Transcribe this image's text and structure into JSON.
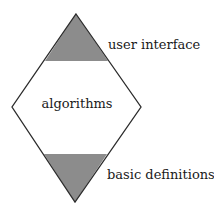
{
  "diagram": {
    "type": "layered-diamond",
    "shape": {
      "top": [
        76,
        14
      ],
      "left": [
        12,
        107
      ],
      "right": [
        141,
        107
      ],
      "bottom": [
        75,
        202
      ]
    },
    "layers": [
      {
        "id": "top-band",
        "label": "user interface",
        "fill": "#8c8c8c",
        "position": "top"
      },
      {
        "id": "middle",
        "label": "algorithms",
        "fill": "#ffffff",
        "position": "middle"
      },
      {
        "id": "bottom-band",
        "label": "basic definitions",
        "fill": "#8c8c8c",
        "position": "bottom"
      }
    ],
    "colors": {
      "stroke": "#2b2b2b",
      "band_fill": "#8c8c8c",
      "background": "#ffffff"
    }
  }
}
